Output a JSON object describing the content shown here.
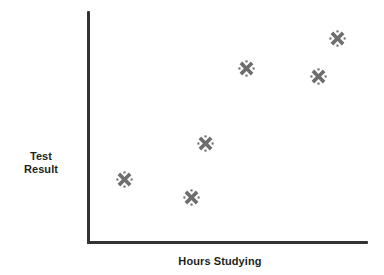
{
  "chart_data": {
    "type": "scatter",
    "title": "",
    "xlabel": "Hours Studying",
    "ylabel": "Test Result",
    "grid": false,
    "legend": null,
    "xlim": [
      0,
      10
    ],
    "ylim": [
      0,
      10
    ],
    "axis_ticks": {
      "x": [],
      "y": []
    },
    "marker": {
      "symbol": "x-cross",
      "color": "#6e6e6e",
      "size": 17
    },
    "series": [
      {
        "name": "Students",
        "points": [
          {
            "x": 1.3,
            "y": 2.7,
            "px": 124,
            "py": 179
          },
          {
            "x": 3.7,
            "y": 1.9,
            "px": 191,
            "py": 197
          },
          {
            "x": 4.2,
            "y": 4.3,
            "px": 205,
            "py": 143
          },
          {
            "x": 5.6,
            "y": 7.5,
            "px": 246,
            "py": 68
          },
          {
            "x": 8.2,
            "y": 7.2,
            "px": 318,
            "py": 76
          },
          {
            "x": 8.9,
            "y": 8.8,
            "px": 337,
            "py": 38
          }
        ]
      }
    ]
  },
  "axes": {
    "x_label": "Hours Studying",
    "y_label_line1": "Test",
    "y_label_line2": "Result",
    "line_color": "#333333"
  },
  "colors": {
    "background": "#ffffff",
    "axis": "#333333",
    "marker": "#6e6e6e",
    "text": "#231f20"
  }
}
